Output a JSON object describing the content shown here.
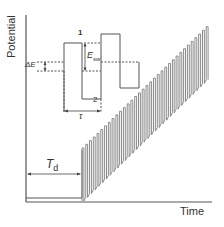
{
  "diagram": {
    "axes": {
      "y_label": "Potential",
      "x_label": "Time"
    },
    "labels": {
      "delay_time": "T",
      "delay_time_sub": "d",
      "step_height": "ΔE",
      "amplitude": "E",
      "amplitude_sub": "sw",
      "period": "τ",
      "pulse_1": "1",
      "pulse_2": "2"
    },
    "colors": {
      "line": "#555555",
      "ramp_fill": "#8a8a8a",
      "text": "#333333",
      "background": "#ffffff"
    },
    "waveform": {
      "pulse_count": 34,
      "baseline_y": 198,
      "ramp_start_x": 82,
      "ramp_end_x": 210,
      "ramp_start_top_y": 148,
      "ramp_end_top_y": 23,
      "pulse_amplitude_px": 18
    }
  }
}
